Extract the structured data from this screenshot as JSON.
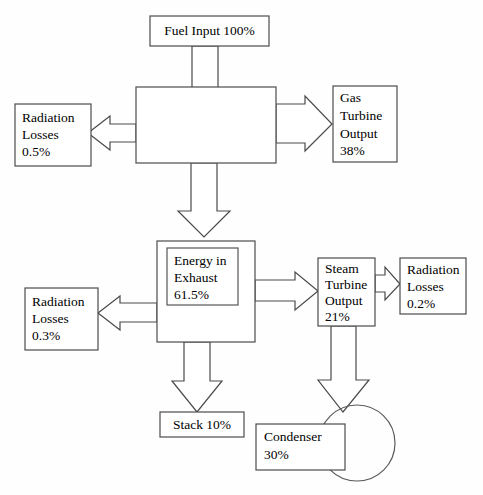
{
  "diagram": {
    "type": "energy-flow-block-diagram",
    "canvas": {
      "width": 483,
      "height": 495
    },
    "style": {
      "box_fill": "#ffffff",
      "box_stroke": "#4c4c4c",
      "arrow_fill": "#ffffff",
      "arrow_stroke": "#4a4a4a",
      "text_color": "#000000",
      "background": "#ffffff"
    },
    "nodes": [
      {
        "id": "fuel-input",
        "name": "fuel-input-box",
        "lines": [
          "Fuel Input 100%"
        ],
        "value": "100%",
        "shape": "rect",
        "align": "center",
        "x": 150,
        "y": 16,
        "w": 119,
        "h": 30
      },
      {
        "id": "gas-turbine-chamber",
        "name": "gas-turbine-chamber-box",
        "lines": [],
        "value": "",
        "shape": "rect",
        "align": "left",
        "x": 136,
        "y": 87,
        "w": 140,
        "h": 76
      },
      {
        "id": "radiation-losses-1",
        "name": "radiation-losses-upper-box",
        "lines": [
          "Radiation",
          "Losses",
          "0.5%"
        ],
        "value": "0.5%",
        "shape": "rect",
        "align": "left",
        "x": 15,
        "y": 104,
        "w": 76,
        "h": 62
      },
      {
        "id": "gas-turbine-output",
        "name": "gas-turbine-output-box",
        "lines": [
          "Gas",
          "Turbine",
          "Output",
          "38%"
        ],
        "value": "38%",
        "shape": "rect",
        "align": "left",
        "x": 333,
        "y": 86,
        "w": 64,
        "h": 76
      },
      {
        "id": "energy-in-exhaust-outer",
        "name": "energy-in-exhaust-outer-box",
        "lines": [],
        "value": "",
        "shape": "rect",
        "align": "left",
        "x": 157,
        "y": 241,
        "w": 98,
        "h": 101
      },
      {
        "id": "energy-in-exhaust",
        "name": "energy-in-exhaust-box",
        "lines": [
          "Energy in",
          "Exhaust",
          "61.5%"
        ],
        "value": "61.5%",
        "shape": "rect-inner",
        "align": "left",
        "x": 167,
        "y": 248,
        "w": 71,
        "h": 57
      },
      {
        "id": "radiation-losses-2",
        "name": "radiation-losses-lower-box",
        "lines": [
          "Radiation",
          "Losses",
          "0.3%"
        ],
        "value": "0.3%",
        "shape": "rect",
        "align": "left",
        "x": 25,
        "y": 288,
        "w": 73,
        "h": 62
      },
      {
        "id": "steam-turbine-output",
        "name": "steam-turbine-output-box",
        "lines": [
          "Steam",
          "Turbine",
          "Output",
          "21%"
        ],
        "value": "21%",
        "shape": "rect",
        "align": "left",
        "x": 318,
        "y": 258,
        "w": 57,
        "h": 68
      },
      {
        "id": "radiation-losses-3",
        "name": "radiation-losses-steam-box",
        "lines": [
          "Radiation",
          "Losses",
          "0.2%"
        ],
        "value": "0.2%",
        "shape": "rect",
        "align": "left",
        "x": 400,
        "y": 258,
        "w": 66,
        "h": 56
      },
      {
        "id": "stack",
        "name": "stack-box",
        "lines": [
          "Stack 10%"
        ],
        "value": "10%",
        "shape": "rect",
        "align": "center",
        "x": 160,
        "y": 412,
        "w": 84,
        "h": 25
      },
      {
        "id": "condenser",
        "name": "condenser-box",
        "lines": [
          "Condenser",
          "30%"
        ],
        "value": "30%",
        "shape": "rect",
        "align": "left",
        "x": 256,
        "y": 424,
        "w": 89,
        "h": 46
      },
      {
        "id": "condenser-circle",
        "name": "condenser-circle-shape",
        "lines": [],
        "value": "",
        "shape": "circle",
        "align": "center",
        "cx": 357,
        "cy": 443,
        "r": 38
      }
    ],
    "flows": [
      {
        "id": "flow-fuel-to-chamber",
        "name": "arrow-fuel-input-to-chamber",
        "from": "fuel-input",
        "to": "gas-turbine-chamber",
        "direction": "down",
        "label": "Fuel Input 100%"
      },
      {
        "id": "flow-chamber-to-radiation1",
        "name": "arrow-chamber-to-radiation-losses-upper",
        "from": "gas-turbine-chamber",
        "to": "radiation-losses-1",
        "direction": "left",
        "label": "Radiation Losses 0.5%"
      },
      {
        "id": "flow-chamber-to-gas-turbine",
        "name": "arrow-chamber-to-gas-turbine-output",
        "from": "gas-turbine-chamber",
        "to": "gas-turbine-output",
        "direction": "right",
        "label": "Gas Turbine Output 38%"
      },
      {
        "id": "flow-chamber-to-exhaust",
        "name": "arrow-chamber-to-energy-in-exhaust",
        "from": "gas-turbine-chamber",
        "to": "energy-in-exhaust-outer",
        "direction": "down",
        "label": "Energy in Exhaust 61.5%"
      },
      {
        "id": "flow-exhaust-to-radiation2",
        "name": "arrow-exhaust-to-radiation-losses-lower",
        "from": "energy-in-exhaust-outer",
        "to": "radiation-losses-2",
        "direction": "left",
        "label": "Radiation Losses 0.3%"
      },
      {
        "id": "flow-exhaust-to-steam-turbine",
        "name": "arrow-exhaust-to-steam-turbine-output",
        "from": "energy-in-exhaust-outer",
        "to": "steam-turbine-output",
        "direction": "right",
        "label": "Steam Turbine Output 21%"
      },
      {
        "id": "flow-steam-to-radiation3",
        "name": "arrow-steam-turbine-to-radiation-losses",
        "from": "steam-turbine-output",
        "to": "radiation-losses-3",
        "direction": "right",
        "label": "Radiation Losses 0.2%"
      },
      {
        "id": "flow-exhaust-to-stack",
        "name": "arrow-exhaust-to-stack",
        "from": "energy-in-exhaust-outer",
        "to": "stack",
        "direction": "down",
        "label": "Stack 10%"
      },
      {
        "id": "flow-steam-to-condenser",
        "name": "arrow-steam-turbine-to-condenser",
        "from": "steam-turbine-output",
        "to": "condenser-circle",
        "direction": "down",
        "label": "Condenser 30%"
      }
    ],
    "energy_balance": {
      "input": "100%",
      "outputs": [
        {
          "label": "Gas Turbine Output",
          "value": "38%"
        },
        {
          "label": "Steam Turbine Output",
          "value": "21%"
        },
        {
          "label": "Stack",
          "value": "10%"
        },
        {
          "label": "Condenser",
          "value": "30%"
        },
        {
          "label": "Radiation Losses (gas turbine)",
          "value": "0.5%"
        },
        {
          "label": "Radiation Losses (exhaust)",
          "value": "0.3%"
        },
        {
          "label": "Radiation Losses (steam turbine)",
          "value": "0.2%"
        }
      ],
      "intermediate": [
        {
          "label": "Energy in Exhaust",
          "value": "61.5%"
        }
      ]
    }
  }
}
